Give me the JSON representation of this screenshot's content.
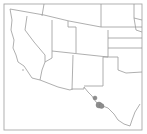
{
  "map": {
    "region": "Southwestern United States",
    "frame_color": "#a8a8a8",
    "border_color": "#9a9a9a",
    "point_color": "#8c8c8c",
    "occurrence_points": [
      {
        "label": "occurrence-1",
        "x": 95,
        "y": 98,
        "r": 2
      },
      {
        "label": "occurrence-2",
        "x": 99,
        "y": 105,
        "r": 3
      },
      {
        "label": "occurrence-3",
        "x": 101,
        "y": 106,
        "r": 2.5
      }
    ]
  }
}
